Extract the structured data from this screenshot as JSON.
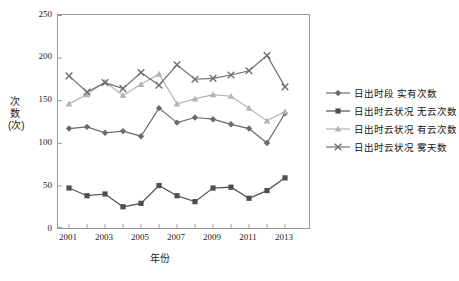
{
  "chart_data": {
    "type": "line",
    "title": "",
    "xlabel": "年份",
    "ylabel": "次数(次)",
    "categories": [
      2001,
      2002,
      2003,
      2004,
      2005,
      2006,
      2007,
      2008,
      2009,
      2010,
      2011,
      2012,
      2013
    ],
    "xticks": [
      "2001",
      "2003",
      "2005",
      "2007",
      "2009",
      "2011",
      "2013"
    ],
    "yticks": [
      "0",
      "50",
      "100",
      "150",
      "200",
      "250"
    ],
    "ylim": [
      0,
      250
    ],
    "xlim": [
      2000.4,
      2013.6
    ],
    "grid": false,
    "legend_position": "right",
    "series": [
      {
        "name": "日出时段 实有次数",
        "marker": "diamond",
        "color": "#6b6b6b",
        "values": [
          117,
          119,
          112,
          114,
          108,
          141,
          124,
          130,
          128,
          122,
          117,
          100,
          135
        ]
      },
      {
        "name": "日出时云状况 无云次数",
        "marker": "square",
        "color": "#4f4f4f",
        "values": [
          47,
          38,
          40,
          25,
          29,
          50,
          38,
          31,
          47,
          48,
          35,
          44,
          59
        ]
      },
      {
        "name": "日出时云状况 有云次数",
        "marker": "triangle",
        "color": "#b4b4b4",
        "values": [
          146,
          157,
          172,
          156,
          169,
          181,
          146,
          152,
          157,
          155,
          141,
          126,
          137
        ]
      },
      {
        "name": "日出时云状况 雾天数",
        "marker": "cross",
        "color": "#6e6e6e",
        "values": [
          179,
          160,
          171,
          164,
          183,
          168,
          192,
          175,
          176,
          180,
          185,
          203,
          166
        ]
      }
    ]
  },
  "axis": {
    "y_title": "次数(次)",
    "x_title": "年份"
  }
}
